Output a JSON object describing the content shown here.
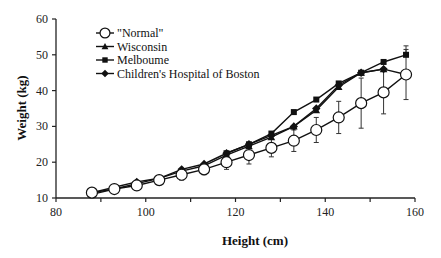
{
  "chart_data": {
    "type": "line",
    "title": "",
    "xlabel": "Height  (cm)",
    "ylabel": "Weight  (kg)",
    "xlim": [
      80,
      160
    ],
    "ylim": [
      10,
      60
    ],
    "xticks": [
      80,
      100,
      120,
      140,
      160
    ],
    "yticks": [
      10,
      20,
      30,
      40,
      50,
      60
    ],
    "grid": false,
    "legend_position": "upper-left",
    "x": [
      88,
      93,
      98,
      103,
      108,
      113,
      118,
      123,
      128,
      133,
      138,
      143,
      148,
      153,
      158
    ],
    "series": [
      {
        "name": "\"Normal\"",
        "marker": "open-circle",
        "x": [
          88,
          93,
          98,
          103,
          108,
          113,
          118,
          123,
          128,
          133,
          138,
          143,
          148,
          153,
          158
        ],
        "values": [
          11.5,
          12.5,
          13.5,
          15,
          16.5,
          18,
          20,
          22,
          24,
          26,
          29,
          32.5,
          36.5,
          39.5,
          44.5
        ],
        "error": [
          0.5,
          1,
          1,
          1,
          1.5,
          1.5,
          2,
          2.5,
          2.5,
          3,
          3.5,
          4.5,
          7,
          6,
          7
        ]
      },
      {
        "name": "Wisconsin",
        "marker": "filled-triangle",
        "x": [
          88,
          93,
          98,
          103,
          108,
          113,
          118,
          123,
          128,
          133,
          138,
          143,
          148,
          153
        ],
        "values": [
          11,
          12.5,
          14,
          15.5,
          17.5,
          19,
          22,
          24.5,
          27,
          30,
          34.5,
          41,
          45,
          46
        ]
      },
      {
        "name": "Melboume",
        "marker": "filled-square",
        "x": [
          118,
          123,
          128,
          133,
          138,
          143,
          148,
          153,
          158
        ],
        "values": [
          22.5,
          25,
          28,
          34,
          37.5,
          42,
          45,
          48,
          50
        ],
        "error_top_only": [
          0,
          0,
          0,
          0,
          0,
          0,
          0,
          0,
          2.5
        ]
      },
      {
        "name": "Children's Hospital of Boston",
        "marker": "filled-diamond",
        "x": [
          88,
          93,
          98,
          103,
          108,
          113,
          118,
          123,
          128,
          133,
          138,
          143,
          148,
          153,
          158
        ],
        "values": [
          11.5,
          13,
          14.5,
          15.5,
          18,
          19.5,
          22.5,
          25,
          27.5,
          30,
          35,
          41.5,
          45,
          46,
          44.5
        ]
      }
    ]
  }
}
